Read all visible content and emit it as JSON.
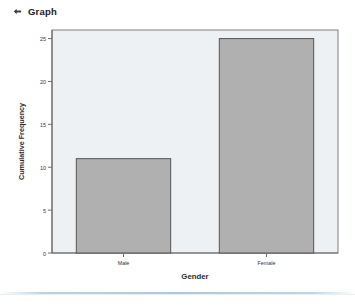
{
  "header": {
    "icon": "diamond-bullet-icon",
    "title": "Graph"
  },
  "colors": {
    "plot_background": "#eef1f4",
    "bar_fill": "#b0b0b0",
    "bar_outline": "#555555",
    "axis": "#808080",
    "text": "#333333",
    "divider": "#a9cadf"
  },
  "chart_data": {
    "type": "bar",
    "title": "",
    "categories": [
      "Male",
      "Female"
    ],
    "values": [
      11,
      25
    ],
    "xlabel": "Gender",
    "ylabel": "Cumulative Frequency",
    "ylim": [
      0,
      26
    ],
    "yticks": [
      "0",
      "5",
      "10",
      "15",
      "20",
      "25"
    ],
    "ytick_values": [
      0,
      5,
      10,
      15,
      20,
      25
    ],
    "grid": false,
    "legend": "none"
  }
}
